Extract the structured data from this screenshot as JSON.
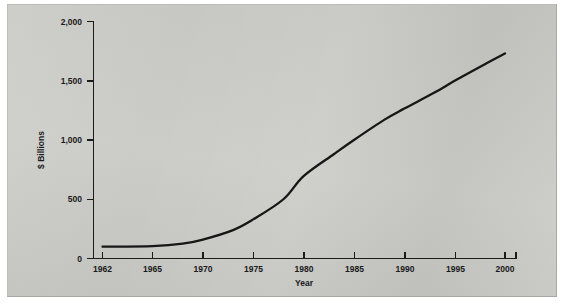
{
  "figure": {
    "background_color": "#c9c9c5",
    "line_color": "#161616",
    "text_color": "#1a1a1a"
  },
  "chart_data": {
    "type": "line",
    "title": "",
    "xlabel": "Year",
    "ylabel": "$ Billions",
    "x": [
      1962,
      1965,
      1970,
      1975,
      1980,
      1985,
      1990,
      1995,
      2000
    ],
    "values": [
      100,
      105,
      160,
      330,
      695,
      1000,
      1265,
      1500,
      1730
    ],
    "xtick_labels": [
      "1962",
      "1965",
      "1970",
      "1975",
      "1980",
      "1985",
      "1990",
      "1995",
      "2000"
    ],
    "ytick_values": [
      0,
      500,
      1000,
      1500,
      2000
    ],
    "ytick_labels": [
      "0",
      "500",
      "1,000",
      "1,500",
      "2,000"
    ],
    "xlim": [
      1962,
      2000
    ],
    "ylim": [
      0,
      2000
    ],
    "grid": false,
    "legend": false,
    "series": [
      {
        "name": "$ Billions",
        "points": [
          {
            "year": 1962,
            "value": 100
          },
          {
            "year": 1965,
            "value": 105
          },
          {
            "year": 1968,
            "value": 125
          },
          {
            "year": 1970,
            "value": 160
          },
          {
            "year": 1973,
            "value": 240
          },
          {
            "year": 1975,
            "value": 330
          },
          {
            "year": 1978,
            "value": 500
          },
          {
            "year": 1980,
            "value": 695
          },
          {
            "year": 1983,
            "value": 880
          },
          {
            "year": 1985,
            "value": 1000
          },
          {
            "year": 1988,
            "value": 1170
          },
          {
            "year": 1990,
            "value": 1265
          },
          {
            "year": 1993,
            "value": 1400
          },
          {
            "year": 1995,
            "value": 1500
          },
          {
            "year": 1998,
            "value": 1640
          },
          {
            "year": 2000,
            "value": 1730
          }
        ]
      }
    ]
  }
}
